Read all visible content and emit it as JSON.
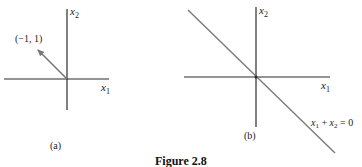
{
  "figure": {
    "caption": "Figure 2.8",
    "panel_a": {
      "label": "(a)",
      "x_axis_var": "x",
      "x_axis_sub": "1",
      "y_axis_var": "x",
      "y_axis_sub": "2",
      "vector_label": "(−1, 1)",
      "vector": [
        -1,
        1
      ]
    },
    "panel_b": {
      "label": "(b)",
      "x_axis_var": "x",
      "x_axis_sub": "1",
      "y_axis_var": "x",
      "y_axis_sub": "2",
      "line_equation": {
        "a": "x",
        "a_sub": "1",
        "op": " + ",
        "b": "x",
        "b_sub": "2",
        "rhs": " = 0"
      }
    },
    "colors": {
      "axis": "#2a2a2a",
      "vector": "#777777",
      "line": "#7a7a7a"
    }
  }
}
